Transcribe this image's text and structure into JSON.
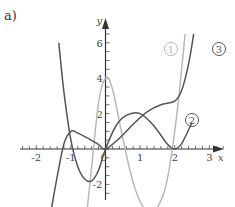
{
  "panel_label": "a)",
  "axes": {
    "x_label": "x",
    "y_label": "y",
    "x_ticks": [
      "-2",
      "-1",
      "0",
      "1",
      "2",
      "3"
    ],
    "y_ticks": [
      "6",
      "4",
      "2",
      "-2"
    ]
  },
  "curve_labels": {
    "c1": "1",
    "c2": "2",
    "c3": "3"
  },
  "colors": {
    "curve1": "#b8b8b8",
    "curve2": "#555555",
    "curve3": "#555555",
    "axis": "#333333"
  },
  "chart_data": {
    "type": "line",
    "title": "a)",
    "xlabel": "x",
    "ylabel": "y",
    "xlim": [
      -2.3,
      3.4
    ],
    "ylim": [
      -2.8,
      6.8
    ],
    "grid": false,
    "x_ticks": [
      -2,
      -1,
      0,
      1,
      2,
      3
    ],
    "y_ticks": [
      -2,
      2,
      4,
      6
    ],
    "series": [
      {
        "name": "1",
        "color": "light gray",
        "x": [
          -0.55,
          -0.4,
          -0.2,
          0,
          0.2,
          0.5,
          0.8,
          1.1,
          1.4,
          1.7,
          1.9,
          2.1,
          2.3
        ],
        "y": [
          -3.8,
          -1.0,
          2.6,
          4.0,
          3.4,
          0.6,
          -1.9,
          -3.3,
          -3.5,
          -2.4,
          -0.4,
          2.6,
          6.5
        ]
      },
      {
        "name": "2",
        "color": "dark gray",
        "x": [
          -1.35,
          -1.2,
          -1.0,
          -0.8,
          -0.6,
          -0.4,
          -0.2,
          0,
          0.3,
          0.6,
          1.0,
          1.4,
          1.8,
          2.0,
          2.2,
          2.5
        ],
        "y": [
          6.0,
          3.2,
          0.5,
          -1.0,
          -1.7,
          -1.8,
          -1.2,
          0.0,
          1.3,
          1.9,
          2.0,
          1.3,
          0.25,
          0.0,
          0.3,
          1.5
        ]
      },
      {
        "name": "3",
        "color": "dark gray",
        "x": [
          -1.6,
          -1.4,
          -1.2,
          -1.0,
          -0.8,
          -0.5,
          -0.2,
          0,
          0.4,
          0.8,
          1.2,
          1.6,
          2.0,
          2.2,
          2.4,
          2.55
        ],
        "y": [
          -3.8,
          -1.6,
          0.3,
          1.0,
          0.9,
          0.6,
          0.25,
          0.0,
          0.6,
          1.4,
          2.1,
          2.5,
          2.7,
          3.3,
          4.8,
          6.5
        ]
      }
    ]
  }
}
